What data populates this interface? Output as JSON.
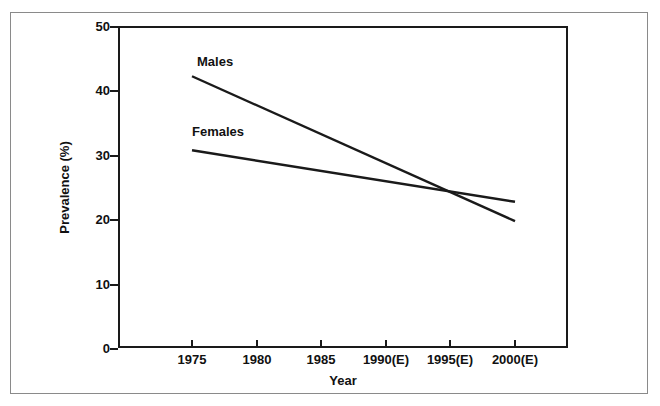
{
  "chart_data": {
    "type": "line",
    "title": "",
    "xlabel": "Year",
    "ylabel": "Prevalence (%)",
    "x": [
      1975,
      2000
    ],
    "x_tick_labels": [
      "1975",
      "1980",
      "1985",
      "1990(E)",
      "1995(E)",
      "2000(E)"
    ],
    "x_tick_values": [
      1975,
      1980,
      1985,
      1990,
      1995,
      2000
    ],
    "xlim": [
      1974,
      2001
    ],
    "y_tick_labels": [
      "0",
      "10",
      "20",
      "30",
      "40",
      "50"
    ],
    "y_tick_values": [
      0,
      10,
      20,
      30,
      40,
      50
    ],
    "ylim": [
      0,
      50
    ],
    "grid": false,
    "legend_position": "inline-labels",
    "series": [
      {
        "name": "Males",
        "label": "Males",
        "color": "#1a1a1a",
        "x": [
          1975,
          2000
        ],
        "values": [
          42.2,
          19.7
        ]
      },
      {
        "name": "Females",
        "label": "Females",
        "color": "#1a1a1a",
        "x": [
          1975,
          2000
        ],
        "values": [
          30.7,
          22.7
        ]
      }
    ],
    "annotations": [
      {
        "text": "Males",
        "x": 1976,
        "y": 45.5
      },
      {
        "text": "Females",
        "x": 1975.5,
        "y": 34.6
      }
    ]
  },
  "axes": {
    "y_ticks": [
      {
        "label": "50",
        "value": 50
      },
      {
        "label": "40",
        "value": 40
      },
      {
        "label": "30",
        "value": 30
      },
      {
        "label": "20",
        "value": 20
      },
      {
        "label": "10",
        "value": 10
      },
      {
        "label": "0",
        "value": 0
      }
    ],
    "x_ticks": [
      {
        "label": "1975",
        "value": 1975
      },
      {
        "label": "1980",
        "value": 1980
      },
      {
        "label": "1985",
        "value": 1985
      },
      {
        "label": "1990(E)",
        "value": 1990
      },
      {
        "label": "1995(E)",
        "value": 1995
      },
      {
        "label": "2000(E)",
        "value": 2000
      }
    ],
    "x_title": "Year",
    "y_title": "Prevalence (%)"
  },
  "style": {
    "line_color": "#1a1a1a",
    "axis_color": "#1a1a1a",
    "frame_color": "#8a8a8a",
    "background": "#ffffff"
  }
}
